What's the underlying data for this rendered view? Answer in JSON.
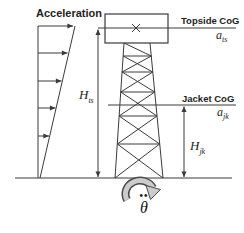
{
  "diagram": {
    "acceleration_label": "Acceleration",
    "topside": {
      "cog_label": "Topside CoG",
      "accel": {
        "base": "a",
        "sub": "ts"
      }
    },
    "jacket": {
      "cog_label": "Jacket CoG",
      "accel": {
        "base": "a",
        "sub": "jk"
      }
    },
    "heights": {
      "topside": {
        "base": "H",
        "sub": "ts"
      },
      "jacket": {
        "base": "H",
        "sub": "jk"
      }
    },
    "rotation": {
      "dots": "••",
      "symbol": "θ"
    },
    "colors": {
      "line": "#3a3a3a",
      "rotation_arrow_fill": "#cccccc",
      "background": "#ffffff"
    }
  }
}
